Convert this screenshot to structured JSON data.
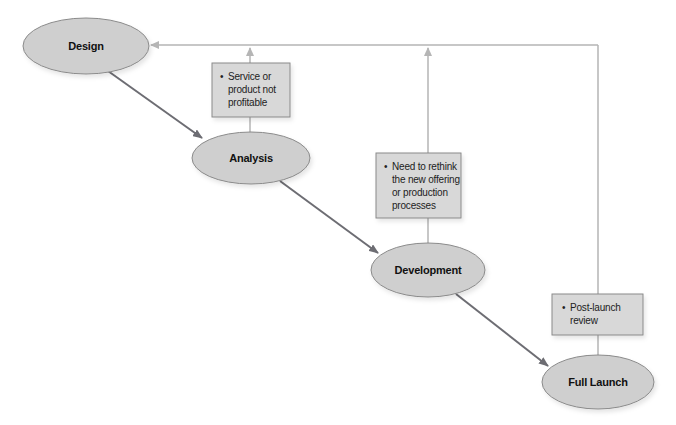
{
  "diagram": {
    "type": "process-flow",
    "colors": {
      "node_fill": "#cfcfcf",
      "node_stroke": "#8a8a8a",
      "note_fill": "#d8d8d8",
      "note_stroke": "#8a8a8a",
      "main_arrow": "#6d6d73",
      "feedback_line": "#b5b5b5"
    },
    "nodes": [
      {
        "id": "design",
        "label": "Design",
        "cx": 86,
        "cy": 46,
        "rx": 63,
        "ry": 28
      },
      {
        "id": "analysis",
        "label": "Analysis",
        "cx": 251,
        "cy": 158,
        "rx": 59,
        "ry": 26
      },
      {
        "id": "development",
        "label": "Development",
        "cx": 428,
        "cy": 270,
        "rx": 57,
        "ry": 27
      },
      {
        "id": "full-launch",
        "label": "Full Launch",
        "cx": 598,
        "cy": 382,
        "rx": 56,
        "ry": 27
      }
    ],
    "notes": [
      {
        "id": "note-analysis",
        "lines": [
          "Service or",
          "product not",
          "profitable"
        ],
        "x": 212,
        "y": 63,
        "w": 78,
        "h": 54
      },
      {
        "id": "note-development",
        "lines": [
          "Need to rethink",
          "the new offering",
          "or production",
          "processes"
        ],
        "x": 376,
        "y": 153,
        "w": 85,
        "h": 65
      },
      {
        "id": "note-launch",
        "lines": [
          "Post-launch",
          "review"
        ],
        "x": 552,
        "y": 294,
        "w": 91,
        "h": 41
      }
    ],
    "flow": [
      "Design",
      "Analysis",
      "Development",
      "Full Launch"
    ],
    "feedback_target": "Design"
  }
}
